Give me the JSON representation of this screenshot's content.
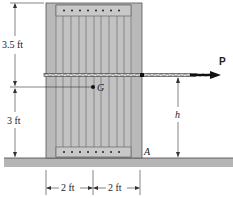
{
  "figure": {
    "labels": {
      "force": "P",
      "center_of_gravity": "G",
      "corner_point": "A",
      "height_var": "h"
    },
    "dimensions": {
      "upper_left_height": "3.5 ft",
      "lower_left_height": "3 ft",
      "bottom_left_width": "2 ft",
      "bottom_right_width": "2 ft"
    },
    "colors": {
      "crate_fill": "#b9b9b9",
      "crate_inner": "#c4c4c4",
      "plank_line": "#6e6e6e",
      "ground_fill": "#b5b5b5",
      "line": "#222222",
      "background": "#ffffff"
    }
  }
}
